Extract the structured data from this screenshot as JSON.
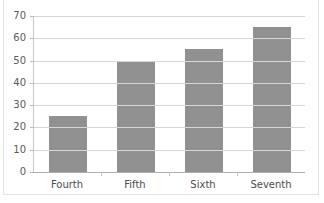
{
  "chart_data": {
    "type": "bar",
    "title": "",
    "xlabel": "",
    "ylabel": "",
    "categories": [
      "Fourth",
      "Fifth",
      "Sixth",
      "Seventh"
    ],
    "values": [
      25,
      50,
      55,
      65
    ],
    "ylim": [
      0,
      70
    ],
    "ytick_labels": [
      "0",
      "10",
      "20",
      "30",
      "40",
      "50",
      "60",
      "70"
    ],
    "ytick_values": [
      0,
      10,
      20,
      30,
      40,
      50,
      60,
      70
    ],
    "grid": true,
    "legend": false,
    "legend_position": "none",
    "bar_color": "#919191",
    "gridline_color": "#d6d6d6",
    "axis_color": "#b0b0b0",
    "tick_label_color": "#4c4c4c"
  },
  "title_fragment": {
    "text": ""
  }
}
